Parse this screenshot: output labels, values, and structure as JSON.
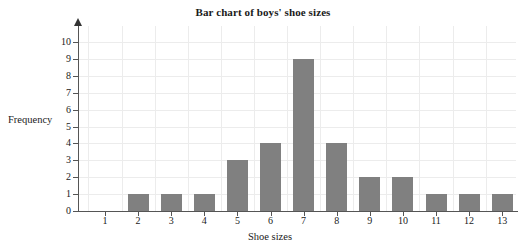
{
  "chart_data": {
    "type": "bar",
    "title": "Bar chart of boys' shoe sizes",
    "xlabel": "Shoe sizes",
    "ylabel": "Frequency",
    "categories": [
      "1",
      "2",
      "3",
      "4",
      "5",
      "6",
      "7",
      "8",
      "9",
      "10",
      "11",
      "12",
      "13"
    ],
    "values": [
      0,
      1,
      1,
      1,
      3,
      4,
      9,
      4,
      2,
      2,
      1,
      1,
      1
    ],
    "ylim": [
      0,
      10
    ],
    "yticks": [
      "0",
      "1",
      "2",
      "3",
      "4",
      "5",
      "6",
      "7",
      "8",
      "9",
      "10"
    ],
    "grid": true,
    "legend": null,
    "bar_color": "#808080",
    "grid_color": "#ececec",
    "axis_color": "#555555",
    "text_color": "#1a1a1a"
  }
}
